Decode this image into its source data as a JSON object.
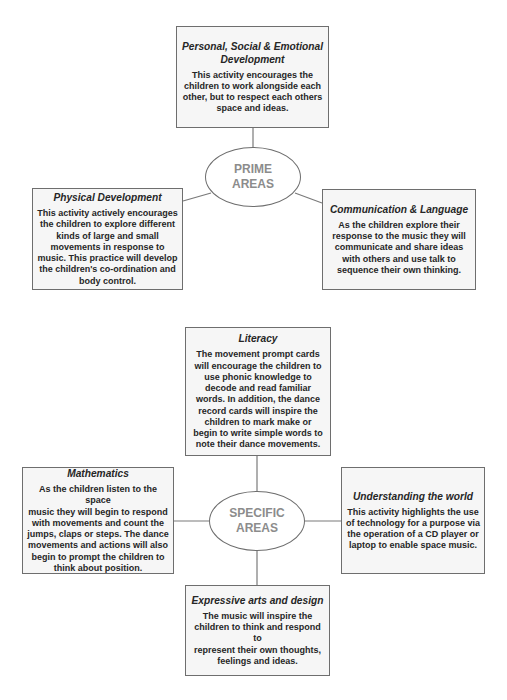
{
  "colors": {
    "border": "#6e6e6e",
    "box_fill": "#f6f6f6",
    "text": "#262626",
    "hub_text": "#8c8c8c",
    "line": "#7a7a7a"
  },
  "prime_areas": {
    "hub_label": "PRIME\nAREAS",
    "boxes": [
      {
        "title": "Personal, Social & Emotional\nDevelopment",
        "body": "This activity encourages the\nchildren to work alongside each\nother, but to respect each others\nspace and ideas."
      },
      {
        "title": "Physical Development",
        "body": "This activity actively encourages\nthe children to explore different\nkinds of large and small\nmovements in response to\nmusic. This practice will develop\nthe children's co-ordination and\nbody control."
      },
      {
        "title": "Communication & Language",
        "body": "As the children explore their\nresponse to the music they will\ncommunicate and share ideas\nwith others and use talk to\nsequence their own thinking."
      }
    ]
  },
  "specific_areas": {
    "hub_label": "SPECIFIC\nAREAS",
    "boxes": [
      {
        "title": "Literacy",
        "body": "The movement prompt cards\nwill encourage the children to\nuse phonic knowledge to\ndecode and read familiar\nwords. In addition, the dance\nrecord cards will inspire the\nchildren to mark make or\nbegin to write simple words to\nnote their dance movements."
      },
      {
        "title": "Mathematics",
        "body": "As the children listen to the space\nmusic they will begin to respond\nwith movements and count the\njumps, claps or steps. The dance\nmovements and actions will also\nbegin to prompt the children to\nthink about position."
      },
      {
        "title": "Understanding the world",
        "body": "This activity highlights the use\nof technology for a purpose via\nthe operation of a CD player or\nlaptop to enable space music."
      },
      {
        "title": "Expressive arts and design",
        "body": "The music will inspire the\nchildren to think and respond to\nrepresent their own thoughts,\nfeelings and ideas."
      }
    ]
  }
}
